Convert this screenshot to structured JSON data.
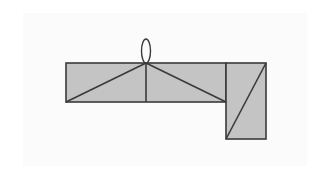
{
  "diagram": {
    "type": "geometric-figure",
    "colors": {
      "background": "#ffffff",
      "panel": "#fbfbfb",
      "fill": "#c4c4c4",
      "stroke": "#3a3a3a"
    },
    "shapes": {
      "main_rectangle": {
        "x": 66,
        "y": 63,
        "width": 160,
        "height": 39
      },
      "side_rectangle": {
        "x": 226,
        "y": 63,
        "width": 40,
        "height": 76
      },
      "loop_ellipse": {
        "cx": 146,
        "cy": 51,
        "rx": 4.5,
        "ry": 12
      },
      "apex": {
        "x": 146,
        "y": 63
      }
    },
    "lines": [
      {
        "name": "left-diagonal",
        "x1": 146,
        "y1": 63,
        "x2": 66,
        "y2": 102
      },
      {
        "name": "center-vertical",
        "x1": 146,
        "y1": 63,
        "x2": 146,
        "y2": 102
      },
      {
        "name": "right-diagonal",
        "x1": 146,
        "y1": 63,
        "x2": 226,
        "y2": 102
      },
      {
        "name": "side-diagonal",
        "x1": 266,
        "y1": 63,
        "x2": 226,
        "y2": 139
      }
    ]
  }
}
